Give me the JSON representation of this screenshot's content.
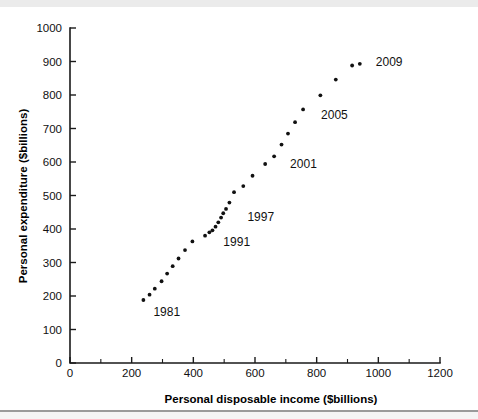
{
  "chart_data": {
    "type": "scatter",
    "title": "",
    "xlabel": "Personal disposable income ($billions)",
    "ylabel": "Personal expenditure ($billions)",
    "xlim": [
      0,
      1200
    ],
    "ylim": [
      0,
      1000
    ],
    "x_ticks": [
      0,
      200,
      400,
      600,
      800,
      1000,
      1200
    ],
    "y_ticks": [
      0,
      100,
      200,
      300,
      400,
      500,
      600,
      700,
      800,
      900,
      1000
    ],
    "x_minor_step": 100,
    "grid": false,
    "legend": "none",
    "marker": "dot",
    "marker_color": "#111111",
    "points": [
      {
        "year": 1981,
        "x": 238,
        "y": 188,
        "label": "1981",
        "label_dx": 10,
        "label_dy": 16
      },
      {
        "year": 1982,
        "x": 258,
        "y": 204,
        "label": "",
        "label_dx": 0,
        "label_dy": 0
      },
      {
        "year": 1983,
        "x": 275,
        "y": 222,
        "label": "",
        "label_dx": 0,
        "label_dy": 0
      },
      {
        "year": 1984,
        "x": 297,
        "y": 244,
        "label": "",
        "label_dx": 0,
        "label_dy": 0
      },
      {
        "year": 1985,
        "x": 315,
        "y": 267,
        "label": "",
        "label_dx": 0,
        "label_dy": 0
      },
      {
        "year": 1986,
        "x": 333,
        "y": 289,
        "label": "",
        "label_dx": 0,
        "label_dy": 0
      },
      {
        "year": 1987,
        "x": 352,
        "y": 312,
        "label": "",
        "label_dx": 0,
        "label_dy": 0
      },
      {
        "year": 1988,
        "x": 373,
        "y": 337,
        "label": "",
        "label_dx": 0,
        "label_dy": 0
      },
      {
        "year": 1989,
        "x": 397,
        "y": 363,
        "label": "",
        "label_dx": 0,
        "label_dy": 0
      },
      {
        "year": 1990,
        "x": 438,
        "y": 380,
        "label": "",
        "label_dx": 0,
        "label_dy": 0
      },
      {
        "year": 1991,
        "x": 452,
        "y": 390,
        "label": "1991",
        "label_dx": 14,
        "label_dy": 14
      },
      {
        "year": 1992,
        "x": 462,
        "y": 396,
        "label": "",
        "label_dx": 0,
        "label_dy": 0
      },
      {
        "year": 1993,
        "x": 472,
        "y": 407,
        "label": "",
        "label_dx": 0,
        "label_dy": 0
      },
      {
        "year": 1994,
        "x": 481,
        "y": 420,
        "label": "",
        "label_dx": 0,
        "label_dy": 0
      },
      {
        "year": 1995,
        "x": 490,
        "y": 434,
        "label": "",
        "label_dx": 0,
        "label_dy": 0
      },
      {
        "year": 1996,
        "x": 497,
        "y": 447,
        "label": "",
        "label_dx": 0,
        "label_dy": 0
      },
      {
        "year": 1997,
        "x": 506,
        "y": 460,
        "label": "",
        "label_dx": 0,
        "label_dy": 0
      },
      {
        "year": 1998,
        "x": 517,
        "y": 479,
        "label": "1997",
        "label_dx": 18,
        "label_dy": 18
      },
      {
        "year": 1999,
        "x": 532,
        "y": 510,
        "label": "",
        "label_dx": 0,
        "label_dy": 0
      },
      {
        "year": 2000,
        "x": 562,
        "y": 528,
        "label": "",
        "label_dx": 0,
        "label_dy": 0
      },
      {
        "year": 2001,
        "x": 592,
        "y": 559,
        "label": "",
        "label_dx": 0,
        "label_dy": 0
      },
      {
        "year": 2002,
        "x": 633,
        "y": 594,
        "label": "",
        "label_dx": 0,
        "label_dy": 0
      },
      {
        "year": 2003,
        "x": 662,
        "y": 617,
        "label": "2001",
        "label_dx": 16,
        "label_dy": 12
      },
      {
        "year": 2004,
        "x": 686,
        "y": 652,
        "label": "",
        "label_dx": 0,
        "label_dy": 0
      },
      {
        "year": 2005,
        "x": 707,
        "y": 685,
        "label": "",
        "label_dx": 0,
        "label_dy": 0
      },
      {
        "year": 2006,
        "x": 730,
        "y": 719,
        "label": "",
        "label_dx": 0,
        "label_dy": 0
      },
      {
        "year": 2007,
        "x": 756,
        "y": 757,
        "label": "2005",
        "label_dx": 18,
        "label_dy": 10
      },
      {
        "year": 2008,
        "x": 812,
        "y": 799,
        "label": "",
        "label_dx": 0,
        "label_dy": 0
      },
      {
        "year": 2009,
        "x": 862,
        "y": 846,
        "label": "",
        "label_dx": 0,
        "label_dy": 0
      },
      {
        "year": 2010,
        "x": 915,
        "y": 888,
        "label": "",
        "label_dx": 0,
        "label_dy": 0
      },
      {
        "year": 2011,
        "x": 940,
        "y": 893,
        "label": "2009",
        "label_dx": 16,
        "label_dy": 2
      }
    ],
    "annotations": [
      {
        "text": "1981",
        "x": 238,
        "y": 188
      },
      {
        "text": "1991",
        "x": 452,
        "y": 390
      },
      {
        "text": "1997",
        "x": 517,
        "y": 479
      },
      {
        "text": "2001",
        "x": 662,
        "y": 617
      },
      {
        "text": "2005",
        "x": 756,
        "y": 757
      },
      {
        "text": "2009",
        "x": 940,
        "y": 893
      }
    ]
  },
  "axes": {
    "x_title": "Personal disposable income ($billions)",
    "y_title": "Personal expenditure ($billions)",
    "x_tick_labels": [
      "0",
      "200",
      "400",
      "600",
      "800",
      "1000",
      "1200"
    ],
    "y_tick_labels": [
      "0",
      "100",
      "200",
      "300",
      "400",
      "500",
      "600",
      "700",
      "800",
      "900",
      "1000"
    ]
  },
  "colors": {
    "marker": "#111111",
    "axis": "#1a1a1a",
    "text": "#111111",
    "background": "#ffffff",
    "band": "#ebebeb",
    "rule": "#9a9a9a"
  }
}
